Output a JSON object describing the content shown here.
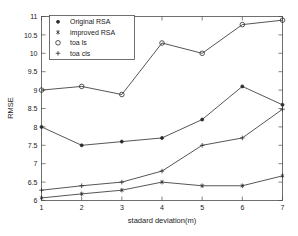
{
  "chart_data": {
    "type": "line",
    "title": "",
    "xlabel": "stadard deviation(m)",
    "ylabel": "RMSE",
    "x": [
      1,
      2,
      3,
      4,
      5,
      6,
      7
    ],
    "xlim": [
      1,
      7
    ],
    "ylim": [
      6,
      11
    ],
    "xticks": [
      "1",
      "2",
      "3",
      "4",
      "5",
      "6",
      "7"
    ],
    "yticks": [
      "6",
      "6.5",
      "7",
      "7.5",
      "8",
      "8.5",
      "9",
      "9.5",
      "10",
      "10.5",
      "11"
    ],
    "grid": false,
    "legend_position": "upper-left",
    "series": [
      {
        "name": "Original RSA",
        "marker": "dot",
        "values": [
          8.0,
          7.5,
          7.6,
          7.7,
          8.2,
          9.1,
          8.6
        ]
      },
      {
        "name": "improved RSA",
        "marker": "star",
        "values": [
          6.07,
          6.18,
          6.28,
          6.5,
          6.4,
          6.4,
          6.67
        ]
      },
      {
        "name": "toa ls",
        "marker": "circle",
        "values": [
          9.0,
          9.1,
          8.88,
          10.28,
          10.0,
          10.78,
          10.9
        ]
      },
      {
        "name": "toa cls",
        "marker": "plus",
        "values": [
          6.28,
          6.4,
          6.5,
          6.8,
          7.5,
          7.7,
          8.48
        ]
      }
    ]
  },
  "legend": {
    "entries": [
      {
        "label": "Original RSA",
        "marker": "dot"
      },
      {
        "label": "improved RSA",
        "marker": "star"
      },
      {
        "label": "toa ls",
        "marker": "circle"
      },
      {
        "label": "toa cls",
        "marker": "plus"
      }
    ]
  },
  "colors": {
    "line": "#2b2b2b",
    "axis": "#4d4d4d",
    "background": "#ffffff",
    "text": "#1a1a1a"
  }
}
